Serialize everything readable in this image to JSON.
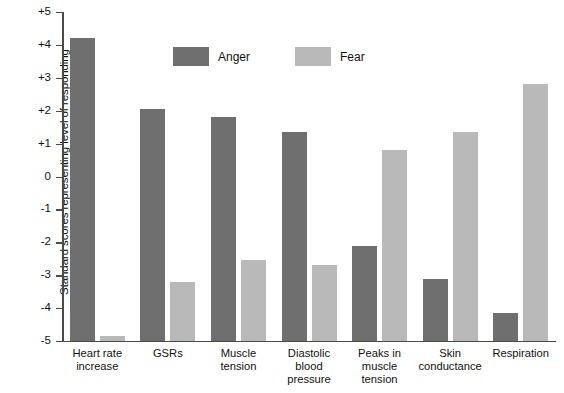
{
  "chart_data": {
    "type": "bar",
    "title": "",
    "xlabel": "",
    "ylabel": "Standard scores representing level of responding",
    "ylim": [
      -5,
      5
    ],
    "ytick_labels": [
      "+5",
      "+4",
      "+3",
      "+2",
      "+1",
      "0",
      "-1",
      "-2",
      "-3",
      "-4",
      "-5"
    ],
    "ytick_values": [
      5,
      4,
      3,
      2,
      1,
      0,
      -1,
      -2,
      -3,
      -4,
      -5
    ],
    "grid": false,
    "legend_position": "upper-left-inside",
    "categories": [
      "Heart rate\nincrease",
      "GSRs",
      "Muscle\ntension",
      "Diastolic\nblood\npressure",
      "Peaks in\nmuscle\ntension",
      "Skin\nconductance",
      "Respiration"
    ],
    "series": [
      {
        "name": "Anger",
        "color": "#6f6f6f",
        "values": [
          4.2,
          2.05,
          1.8,
          1.35,
          -2.1,
          -3.1,
          -4.15
        ]
      },
      {
        "name": "Fear",
        "color": "#b9b9b9",
        "values": [
          -4.85,
          -3.2,
          -2.55,
          -2.7,
          0.8,
          1.35,
          2.8
        ]
      }
    ]
  },
  "legend": {
    "entries": [
      {
        "label": "Anger",
        "color": "#6f6f6f"
      },
      {
        "label": "Fear",
        "color": "#b9b9b9"
      }
    ]
  },
  "axis": {
    "y_title": "Standard scores representing level of responding"
  }
}
